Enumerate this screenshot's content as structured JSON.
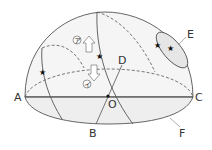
{
  "diagram": {
    "type": "celestial-hemisphere",
    "labels": {
      "A": "A",
      "B": "B",
      "C": "C",
      "D": "D",
      "E": "E",
      "F": "F",
      "O": "O"
    },
    "arrows": {
      "up": "ア",
      "down": "イ"
    },
    "stars": [
      {
        "id": "star-left"
      },
      {
        "id": "star-center"
      },
      {
        "id": "star-e-1"
      },
      {
        "id": "star-e-2"
      }
    ],
    "colors": {
      "line": "#555555",
      "dome_fill": "#f4f4f4",
      "front_fill": "#ececec",
      "background": "#ffffff"
    }
  }
}
